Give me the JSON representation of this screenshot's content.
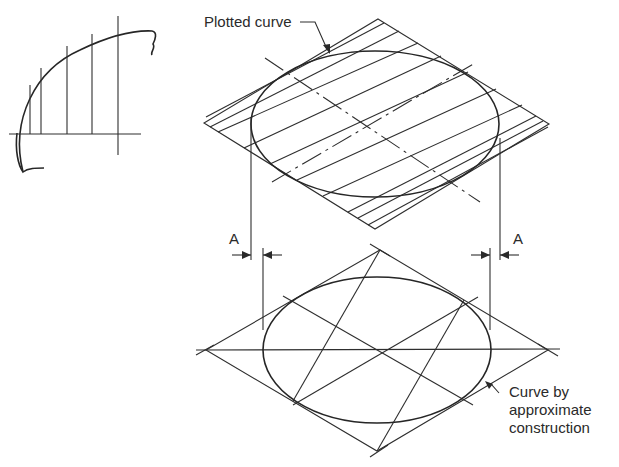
{
  "labels": {
    "plotted_curve": "Plotted curve",
    "dim_left": "A",
    "dim_right": "A",
    "approx_line1": "Curve by",
    "approx_line2": "approximate",
    "approx_line3": "construction"
  },
  "views": {
    "true_shape": "partial circular arc with vertical ordinates",
    "top_view": "isometric rhombus with hatch lines and plotted ellipse",
    "bottom_view": "isometric rhombus with four-centre approximate ellipse construction"
  },
  "colors": {
    "line": "#2e2e2e",
    "background": "#ffffff"
  }
}
